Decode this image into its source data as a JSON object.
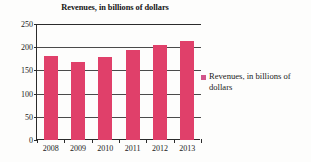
{
  "chart_data": {
    "type": "bar",
    "title": "Revenues, in billions of dollars",
    "xlabel": "",
    "ylabel": "",
    "categories": [
      "2008",
      "2009",
      "2010",
      "2011",
      "2012",
      "2013"
    ],
    "values": [
      181,
      168,
      178,
      194,
      205,
      214
    ],
    "series": [
      {
        "name": "Revenues, in billions of dollars",
        "values": [
          181,
          168,
          178,
          194,
          205,
          214
        ],
        "color": "#e0406a"
      }
    ],
    "ylim": [
      0,
      250
    ],
    "ytick_labels": [
      "0",
      "50",
      "100",
      "150",
      "200",
      "250"
    ],
    "ytick_values": [
      0,
      50,
      100,
      150,
      200,
      250
    ],
    "grid": true,
    "grid_axis": "y",
    "legend_position": "right",
    "legend_entries": [
      {
        "label": "Revenues, in billions of dollars",
        "color": "#d2558a"
      }
    ]
  },
  "legend": {
    "entry_label": "Revenues, in billions of dollars",
    "swatch_name": "legend-color-swatch"
  },
  "colors": {
    "bar": "#e0406a",
    "legend_swatch": "#d2558a",
    "axis": "#2b2b2b",
    "gridline": "#4a4a4a",
    "background": "#fdfdfc",
    "text": "#1a1a1a"
  }
}
